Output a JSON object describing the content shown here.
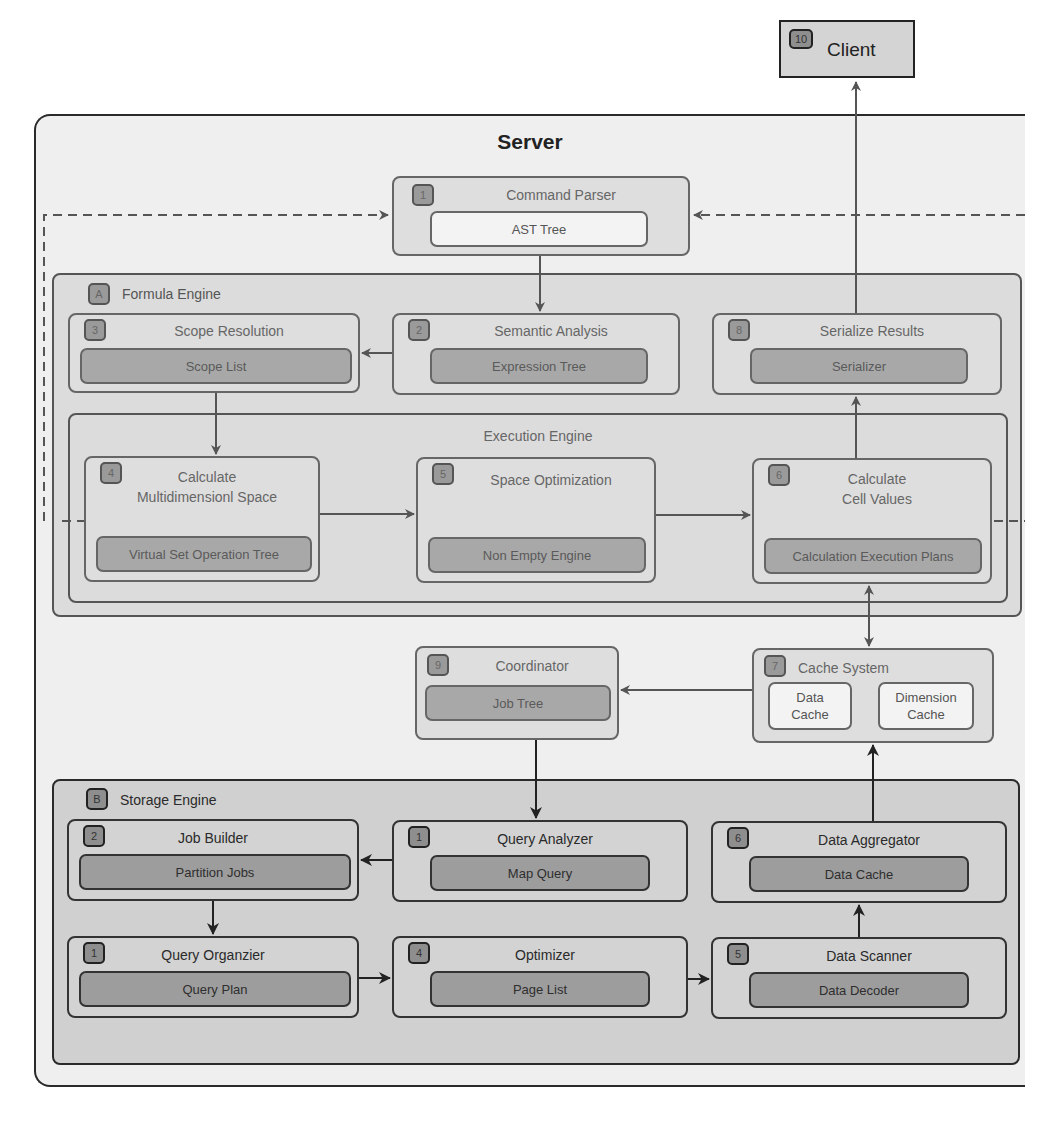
{
  "client": {
    "badge": "10",
    "label": "Client"
  },
  "server": {
    "title": "Server"
  },
  "command_parser": {
    "badge": "1",
    "title": "Command Parser",
    "inner": "AST Tree"
  },
  "formula_engine": {
    "badge": "A",
    "label": "Formula Engine",
    "scope_resolution": {
      "badge": "3",
      "title": "Scope Resolution",
      "inner": "Scope List"
    },
    "semantic_analysis": {
      "badge": "2",
      "title": "Semantic Analysis",
      "inner": "Expression Tree"
    },
    "serialize_results": {
      "badge": "8",
      "title": "Serialize Results",
      "inner": "Serializer"
    },
    "execution_engine": {
      "label": "Execution Engine",
      "calc_space": {
        "badge": "4",
        "title_line1": "Calculate",
        "title_line2": "Multidimensionl Space",
        "inner": "Virtual Set Operation Tree"
      },
      "space_opt": {
        "badge": "5",
        "title": "Space Optimization",
        "inner": "Non Empty Engine"
      },
      "calc_cells": {
        "badge": "6",
        "title_line1": "Calculate",
        "title_line2": "Cell Values",
        "inner": "Calculation Execution Plans"
      }
    }
  },
  "coordinator": {
    "badge": "9",
    "title": "Coordinator",
    "inner": "Job Tree"
  },
  "cache_system": {
    "badge": "7",
    "title": "Cache System",
    "data_cache_line1": "Data",
    "data_cache_line2": "Cache",
    "dim_cache_line1": "Dimension",
    "dim_cache_line2": "Cache"
  },
  "storage_engine": {
    "badge": "B",
    "label": "Storage Engine",
    "job_builder": {
      "badge": "2",
      "title": "Job Builder",
      "inner": "Partition Jobs"
    },
    "query_analyzer": {
      "badge": "1",
      "title": "Query Analyzer",
      "inner": "Map Query"
    },
    "data_aggregator": {
      "badge": "6",
      "title": "Data Aggregator",
      "inner": "Data Cache"
    },
    "query_organizer": {
      "badge": "1",
      "title": "Query Organzier",
      "inner": "Query Plan"
    },
    "optimizer": {
      "badge": "4",
      "title": "Optimizer",
      "inner": "Page List"
    },
    "data_scanner": {
      "badge": "5",
      "title": "Data Scanner",
      "inner": "Data Decoder"
    }
  }
}
